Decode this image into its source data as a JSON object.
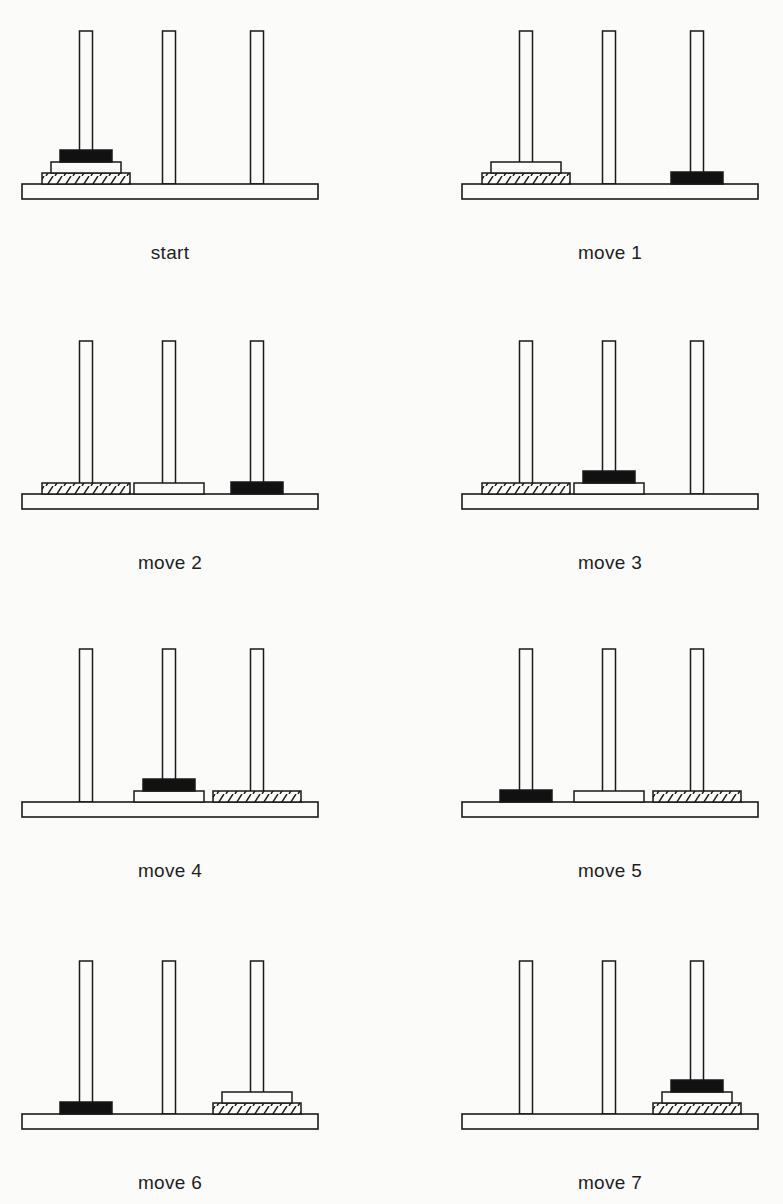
{
  "legend": {
    "disk_small": "black (solid)",
    "disk_medium": "white (plain)",
    "disk_large": "hatched"
  },
  "pegs": [
    "left",
    "middle",
    "right"
  ],
  "panels": [
    {
      "label": "start",
      "left": 0,
      "top": 0,
      "state": {
        "left": [
          "large",
          "medium",
          "small"
        ],
        "middle": [],
        "right": []
      }
    },
    {
      "label": "move 1",
      "left": 440,
      "top": 0,
      "state": {
        "left": [
          "large",
          "medium"
        ],
        "middle": [],
        "right": [
          "small"
        ]
      }
    },
    {
      "label": "move 2",
      "left": 0,
      "top": 310,
      "state": {
        "left": [
          "large"
        ],
        "middle": [
          "medium"
        ],
        "right": [
          "small"
        ]
      }
    },
    {
      "label": "move 3",
      "left": 440,
      "top": 310,
      "state": {
        "left": [
          "large"
        ],
        "middle": [
          "medium",
          "small"
        ],
        "right": []
      }
    },
    {
      "label": "move 4",
      "left": 0,
      "top": 618,
      "state": {
        "left": [],
        "middle": [
          "medium",
          "small"
        ],
        "right": [
          "large"
        ]
      }
    },
    {
      "label": "move 5",
      "left": 440,
      "top": 618,
      "state": {
        "left": [
          "small"
        ],
        "middle": [
          "medium"
        ],
        "right": [
          "large"
        ]
      }
    },
    {
      "label": "move 6",
      "left": 0,
      "top": 930,
      "state": {
        "left": [
          "small"
        ],
        "middle": [],
        "right": [
          "large",
          "medium"
        ]
      }
    },
    {
      "label": "move 7",
      "left": 440,
      "top": 930,
      "state": {
        "left": [],
        "middle": [],
        "right": [
          "large",
          "medium",
          "small"
        ]
      }
    }
  ],
  "colors": {
    "ink": "#1a1a1a",
    "paper": "#fbfbfa",
    "solid": "#111111"
  }
}
